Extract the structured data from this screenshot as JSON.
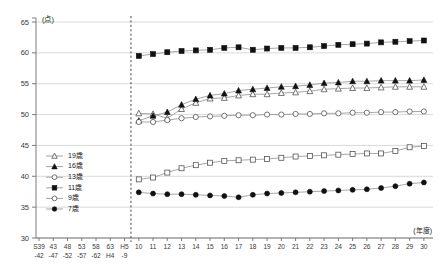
{
  "chart_data": {
    "type": "line",
    "title": "",
    "xlabel": "(年度)",
    "ylabel": "(点)",
    "ylim": [
      30,
      65
    ],
    "yticks": [
      30,
      35,
      40,
      45,
      50,
      55,
      60,
      65
    ],
    "grid": true,
    "legend_position": "inside-left-lower",
    "annotations": [
      {
        "type": "vertical-dashed-line",
        "at": "H9",
        "note": "データ開始境界"
      }
    ],
    "x_major_labels": [
      "S39",
      "43",
      "48",
      "53",
      "58",
      "63",
      "H5",
      "10",
      "11",
      "12",
      "13",
      "14",
      "15",
      "16",
      "17",
      "18",
      "19",
      "20",
      "21",
      "22",
      "23",
      "24",
      "25",
      "26",
      "27",
      "28",
      "29",
      "30"
    ],
    "x_secondary_labels": [
      "-42",
      "-47",
      "-52",
      "-57",
      "-62",
      "H4",
      "-9"
    ],
    "x_plotted": [
      "10",
      "11",
      "12",
      "13",
      "14",
      "15",
      "16",
      "17",
      "18",
      "19",
      "20",
      "21",
      "22",
      "23",
      "24",
      "25",
      "26",
      "27",
      "28",
      "29",
      "30"
    ],
    "series": [
      {
        "name": "19歳",
        "marker": "open-triangle",
        "values": [
          50.2,
          50.1,
          49.4,
          50.9,
          51.9,
          52.6,
          52.7,
          53.1,
          53.3,
          53.3,
          53.5,
          53.6,
          53.8,
          54.1,
          54.2,
          54.3,
          54.3,
          54.4,
          54.5,
          54.5,
          54.5
        ]
      },
      {
        "name": "16歳",
        "marker": "filled-triangle",
        "values": [
          49.0,
          49.8,
          50.4,
          51.6,
          52.5,
          53.1,
          53.4,
          53.9,
          54.1,
          54.3,
          54.5,
          54.6,
          54.8,
          55.1,
          55.2,
          55.4,
          55.4,
          55.5,
          55.5,
          55.5,
          55.6
        ]
      },
      {
        "name": "13歳",
        "marker": "open-circle",
        "values": [
          48.8,
          48.8,
          49.1,
          49.4,
          49.6,
          49.7,
          49.8,
          49.9,
          49.9,
          50.0,
          50.0,
          50.1,
          50.1,
          50.2,
          50.2,
          50.3,
          50.3,
          50.4,
          50.4,
          50.5,
          50.5
        ]
      },
      {
        "name": "11歳",
        "marker": "filled-square",
        "values": [
          59.5,
          59.8,
          60.1,
          60.3,
          60.4,
          60.5,
          60.8,
          60.9,
          60.5,
          60.7,
          60.8,
          60.8,
          60.9,
          61.1,
          61.3,
          61.4,
          61.5,
          61.7,
          61.8,
          61.9,
          62.0
        ]
      },
      {
        "name": "9歳",
        "marker": "open-square",
        "values": [
          39.5,
          39.8,
          40.6,
          41.3,
          41.8,
          42.2,
          42.5,
          42.6,
          42.7,
          42.8,
          43.0,
          43.2,
          43.3,
          43.4,
          43.5,
          43.6,
          43.7,
          43.7,
          44.1,
          44.7,
          44.9
        ]
      },
      {
        "name": "7歳",
        "marker": "filled-circle",
        "values": [
          37.4,
          37.2,
          37.1,
          37.1,
          37.0,
          36.9,
          36.8,
          36.6,
          37.0,
          37.2,
          37.3,
          37.4,
          37.5,
          37.6,
          37.7,
          37.8,
          37.9,
          38.1,
          38.4,
          38.8,
          39.0
        ]
      }
    ]
  },
  "legend": {
    "items": [
      {
        "label": "19歳",
        "marker": "open-triangle"
      },
      {
        "label": "16歳",
        "marker": "filled-triangle"
      },
      {
        "label": "13歳",
        "marker": "open-circle"
      },
      {
        "label": "11歳",
        "marker": "filled-square"
      },
      {
        "label": "9歳",
        "marker": "open-circle-small"
      },
      {
        "label": "7歳",
        "marker": "filled-circle"
      }
    ]
  },
  "colors": {
    "grid": "#c8c8c8",
    "axis": "#6e6e6e",
    "line": "#8a8a8a",
    "marker_fill": "#111111",
    "marker_open": "#ffffff",
    "divider": "#4a4a4a",
    "text": "#1a1a1a"
  }
}
